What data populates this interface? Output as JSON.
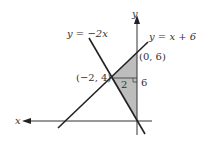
{
  "diagram": {
    "axes": {
      "x_label": "x",
      "y_label": "y"
    },
    "lines": [
      {
        "equation": "y = −2x",
        "label_left": "y = −2x"
      },
      {
        "equation": "y = x + 6",
        "label_left": "y = x + 6"
      }
    ],
    "points": [
      {
        "label": "(0, 6)"
      },
      {
        "label": "(−2, 4)"
      }
    ],
    "measurements": {
      "base": "2",
      "height": "6"
    },
    "colors": {
      "shade": "#bdbdbd",
      "line": "#222222"
    }
  }
}
